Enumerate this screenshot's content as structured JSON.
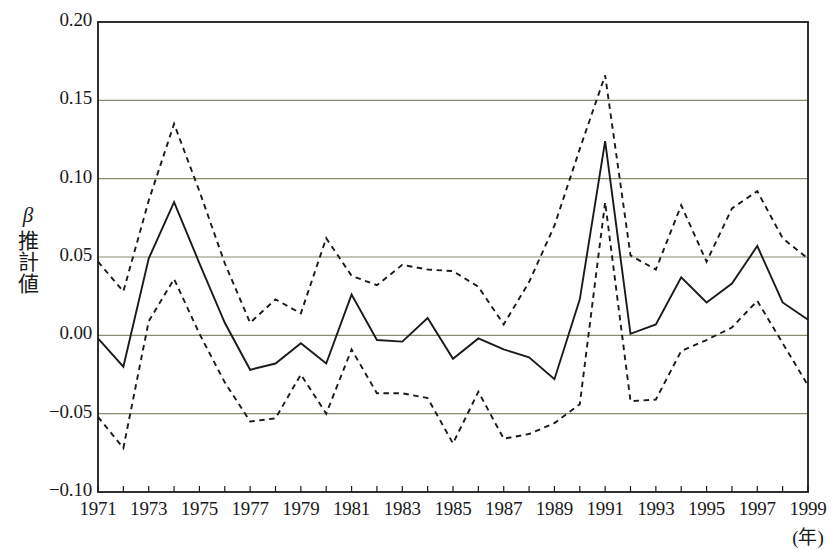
{
  "chart_data": {
    "type": "line",
    "title": "",
    "subtitle": "",
    "xlabel": "(年)",
    "ylabel": "β推計値",
    "ylabel_parts": {
      "symbol": "β",
      "text": "推計値"
    },
    "xlim": [
      1971,
      1999
    ],
    "ylim": [
      -0.1,
      0.2
    ],
    "yticks": [
      0.2,
      0.15,
      0.1,
      0.05,
      0.0,
      -0.05,
      -0.1
    ],
    "ytick_labels": [
      "0.20",
      "0.15",
      "0.10",
      "0.05",
      "0.00",
      "−0.05",
      "−0.10"
    ],
    "xticks": [
      1971,
      1972,
      1973,
      1974,
      1975,
      1976,
      1977,
      1978,
      1979,
      1980,
      1981,
      1982,
      1983,
      1984,
      1985,
      1986,
      1987,
      1988,
      1989,
      1990,
      1991,
      1992,
      1993,
      1994,
      1995,
      1996,
      1997,
      1998,
      1999
    ],
    "xtick_labels": [
      "1971",
      "1973",
      "1975",
      "1977",
      "1979",
      "1981",
      "1983",
      "1985",
      "1987",
      "1989",
      "1991",
      "1993",
      "1995",
      "1997",
      "1999"
    ],
    "xtick_label_years": [
      1971,
      1973,
      1975,
      1977,
      1979,
      1981,
      1983,
      1985,
      1987,
      1989,
      1991,
      1993,
      1995,
      1997,
      1999
    ],
    "grid": "horizontal",
    "legend": "none",
    "x": [
      1971,
      1972,
      1973,
      1974,
      1975,
      1976,
      1977,
      1978,
      1979,
      1980,
      1981,
      1982,
      1983,
      1984,
      1985,
      1986,
      1987,
      1988,
      1989,
      1990,
      1991,
      1992,
      1993,
      1994,
      1995,
      1996,
      1997,
      1998,
      1999
    ],
    "series": [
      {
        "name": "upper-confidence-bound",
        "style": "dashed",
        "color": "#1a1a1a",
        "values": [
          0.047,
          0.028,
          0.086,
          0.135,
          0.092,
          0.046,
          0.008,
          0.023,
          0.014,
          0.062,
          0.038,
          0.032,
          0.045,
          0.042,
          0.041,
          0.031,
          0.007,
          0.034,
          0.07,
          0.119,
          0.166,
          0.051,
          0.042,
          0.083,
          0.047,
          0.081,
          0.092,
          0.062,
          0.049
        ]
      },
      {
        "name": "beta-estimate",
        "style": "solid",
        "color": "#1a1a1a",
        "values": [
          -0.002,
          -0.02,
          0.049,
          0.085,
          0.046,
          0.008,
          -0.022,
          -0.018,
          -0.005,
          -0.018,
          0.026,
          -0.003,
          -0.004,
          0.011,
          -0.015,
          -0.002,
          -0.009,
          -0.014,
          -0.028,
          0.023,
          0.124,
          0.001,
          0.007,
          0.037,
          0.021,
          0.033,
          0.057,
          0.021,
          0.01
        ]
      },
      {
        "name": "lower-confidence-bound",
        "style": "dashed",
        "color": "#1a1a1a",
        "values": [
          -0.052,
          -0.072,
          0.009,
          0.036,
          0.001,
          -0.03,
          -0.055,
          -0.053,
          -0.025,
          -0.05,
          -0.009,
          -0.037,
          -0.037,
          -0.04,
          -0.069,
          -0.036,
          -0.066,
          -0.063,
          -0.056,
          -0.044,
          0.085,
          -0.042,
          -0.041,
          -0.01,
          -0.003,
          0.005,
          0.022,
          -0.005,
          -0.032
        ]
      }
    ],
    "colors": {
      "axis": "#1a1a1a",
      "grid": "#8a8a70",
      "background": "#ffffff",
      "text": "#1a1a1a"
    },
    "plot_area": {
      "left": 98,
      "top": 22,
      "right": 808,
      "bottom": 492
    }
  }
}
